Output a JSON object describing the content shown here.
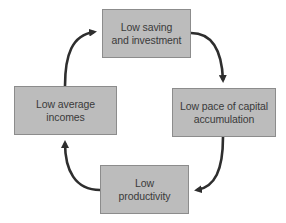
{
  "diagram": {
    "type": "cycle",
    "direction": "clockwise",
    "colors": {
      "box_fill": "#bcbcbc",
      "box_border": "#8c8c8c",
      "text": "#3a3a3a",
      "arrow": "#2e2e2e",
      "background": "#ffffff"
    },
    "nodes": {
      "top": {
        "line1": "Low saving",
        "line2": "and investment"
      },
      "right": {
        "line1": "Low pace of capital",
        "line2": "accumulation"
      },
      "bottom": {
        "line1": "Low",
        "line2": "productivity"
      },
      "left": {
        "line1": "Low average",
        "line2": "incomes"
      }
    },
    "edges": [
      {
        "from": "Low saving and investment",
        "to": "Low pace of capital accumulation"
      },
      {
        "from": "Low pace of capital accumulation",
        "to": "Low productivity"
      },
      {
        "from": "Low productivity",
        "to": "Low average incomes"
      },
      {
        "from": "Low average incomes",
        "to": "Low saving and investment"
      }
    ]
  }
}
